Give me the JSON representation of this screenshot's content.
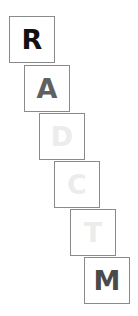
{
  "tiles": [
    {
      "letter": "R",
      "color": "#111111",
      "x": 9,
      "y": 16
    },
    {
      "letter": "A",
      "color": "#606060",
      "x": 24,
      "y": 65
    },
    {
      "letter": "D",
      "color": "#ececec",
      "x": 39,
      "y": 113
    },
    {
      "letter": "C",
      "color": "#ececec",
      "x": 54,
      "y": 161
    },
    {
      "letter": "T",
      "color": "#ececec",
      "x": 70,
      "y": 209
    },
    {
      "letter": "M",
      "color": "#4a4a4a",
      "x": 84,
      "y": 257
    }
  ]
}
